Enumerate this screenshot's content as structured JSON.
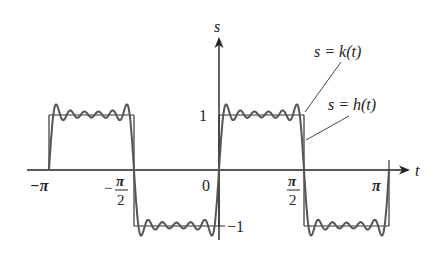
{
  "figure": {
    "axes": {
      "x_label": "t",
      "y_label": "s",
      "x_ticks": [
        {
          "value": -3.14159,
          "label": "−π"
        },
        {
          "value": -1.5708,
          "label_num": "π",
          "label_den": "2",
          "sign": "−"
        },
        {
          "value": 0,
          "label": "0"
        },
        {
          "value": 1.5708,
          "label_num": "π",
          "label_den": "2",
          "sign": ""
        },
        {
          "value": 3.14159,
          "label": "π"
        }
      ],
      "y_ticks": [
        {
          "value": 1,
          "label": "1"
        },
        {
          "value": -1,
          "label": "−1"
        }
      ]
    },
    "curves": [
      {
        "name": "k",
        "label": "s = k(t)",
        "description": "square wave: 0 on (−π,−π/2)? no — piecewise constant ±1",
        "style": "thin dark line"
      },
      {
        "name": "h",
        "label": "s = h(t)",
        "description": "Fourier partial sum approximation with Gibbs ripples",
        "style": "thicker gray line"
      }
    ],
    "annotations": {
      "k_label": "s = k(t)",
      "h_label": "s = h(t)"
    },
    "colors": {
      "axis": "#222222",
      "k_curve": "#333333",
      "h_curve": "#555555"
    }
  },
  "chart_data": {
    "type": "line",
    "title": "",
    "xlabel": "t",
    "ylabel": "s",
    "xlim": [
      -3.3,
      3.6
    ],
    "ylim": [
      -1.25,
      2.4
    ],
    "x_tick_labels": [
      "−π",
      "−π/2",
      "0",
      "π/2",
      "π"
    ],
    "y_tick_labels": [
      "1",
      "−1"
    ],
    "series": [
      {
        "name": "s = k(t)",
        "piecewise": [
          {
            "x": [
              -3.14159,
              -1.5708
            ],
            "y": 1
          },
          {
            "x": [
              -1.5708,
              0
            ],
            "y": -1
          },
          {
            "x": [
              0,
              1.5708
            ],
            "y": 1
          },
          {
            "x": [
              1.5708,
              3.14159
            ],
            "y": -1
          }
        ]
      },
      {
        "name": "s = h(t)",
        "note": "partial Fourier sum of k(t) with ~5 ripples per half-period, overshoot ≈ 1.18"
      }
    ]
  }
}
